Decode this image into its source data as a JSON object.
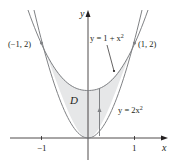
{
  "figure": {
    "type": "region-between-curves",
    "region_label": "D",
    "axes": {
      "x_label": "x",
      "y_label": "y"
    },
    "ticks": {
      "x": [
        {
          "value": -1,
          "label": "−1"
        },
        {
          "value": 1,
          "label": "1"
        }
      ]
    },
    "curves": [
      {
        "name": "upper",
        "equation": "y = 1 + x²",
        "eq_prefix": "y = 1 + x",
        "eq_sup": "2"
      },
      {
        "name": "lower",
        "equation": "y = 2x²",
        "eq_prefix": "y = 2x",
        "eq_sup": "2"
      }
    ],
    "points": [
      {
        "label": "(−1, 2)",
        "x": -1,
        "y": 2
      },
      {
        "label": "(1, 2)",
        "x": 1,
        "y": 2
      }
    ],
    "colors": {
      "region_fill": "#e6e7e8",
      "curve": "#808285",
      "axis": "#231f20",
      "text": "#231f20"
    }
  }
}
